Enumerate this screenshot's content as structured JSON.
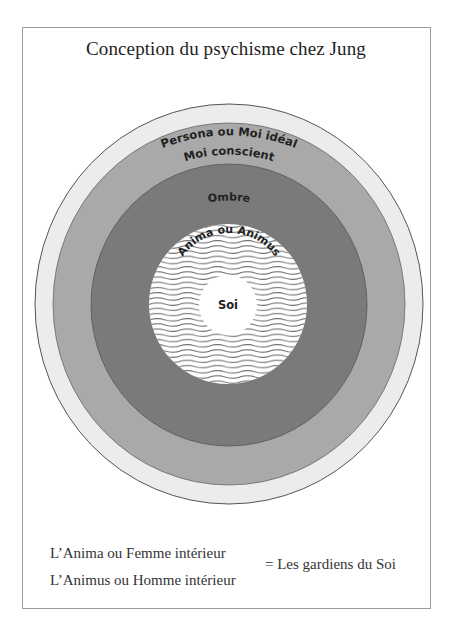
{
  "title": "Conception du psychisme chez Jung",
  "diagram": {
    "type": "concentric-circles",
    "center": {
      "x": 229,
      "y": 304
    },
    "layers": [
      {
        "id": "persona",
        "label": "Persona ou Moi idéal",
        "fill": "#ececec",
        "radius_x": 194,
        "radius_y": 200
      },
      {
        "id": "moi-conscient",
        "label": "Moi conscient",
        "fill": "#a9a9a9",
        "radius_x": 176,
        "radius_y": 181
      },
      {
        "id": "ombre",
        "label": "Ombre",
        "fill": "#7a7a7a",
        "radius_x": 138,
        "radius_y": 141
      },
      {
        "id": "anima-animus",
        "label": "Anima ou Animus",
        "fill": "#ffffff",
        "pattern": "wavy-lines",
        "radius_x": 79,
        "radius_y": 80
      },
      {
        "id": "soi",
        "label": "Soi",
        "fill": "#ffffff",
        "radius_x": 29,
        "radius_y": 30
      }
    ]
  },
  "legend": {
    "line_1": "L’Anima ou Femme intérieur",
    "line_2": "L’Animus ou Homme intérieur",
    "equals": "= Les gardiens du Soi"
  },
  "colors": {
    "frame": "#9a9a9a",
    "text": "#222222",
    "wave_line": "#6f6f6f"
  }
}
